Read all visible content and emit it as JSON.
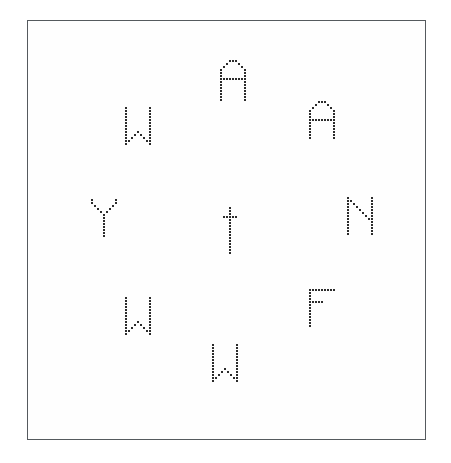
{
  "canvas": {
    "width": 451,
    "height": 463,
    "background_color": "#ffffff"
  },
  "frame": {
    "label": "stimulus-border",
    "x": 27,
    "y": 20,
    "width": 399,
    "height": 420,
    "border_color": "#555a5e",
    "border_width": 1,
    "fill_color": "#fefefe"
  },
  "style": {
    "dot_color": "#2b2b2b",
    "dot_size": 2,
    "dot_pitch": 3,
    "render_mode": "dot-matrix"
  },
  "letters": [
    {
      "id": "letter-top",
      "character": "A",
      "position": "top",
      "x": 220,
      "y": 60,
      "cols": 9,
      "rows": 14,
      "cells": [
        "...###...",
        "..#...#..",
        ".#.....#.",
        "#.......#",
        "#.......#",
        "#.......#",
        "#########",
        "#.......#",
        "#.......#",
        "#.......#",
        "#.......#",
        "#.......#",
        "#.......#",
        "#.......#"
      ]
    },
    {
      "id": "letter-upper-left",
      "character": "W",
      "position": "upper-left",
      "x": 125,
      "y": 107,
      "cols": 9,
      "rows": 13,
      "cells": [
        "#.......#",
        "#.......#",
        "#.......#",
        "#.......#",
        "#.......#",
        "#.......#",
        "#.......#",
        "#.......#",
        "#...#...#",
        "#..#.#..#",
        "#.#...#.#",
        "##.....##",
        "#.......#"
      ]
    },
    {
      "id": "letter-upper-right",
      "character": "A",
      "position": "upper-right",
      "x": 309,
      "y": 101,
      "cols": 9,
      "rows": 13,
      "cells": [
        "...###...",
        "..#...#..",
        ".#.....#.",
        "#.......#",
        "#.......#",
        "#.......#",
        "#########",
        "#.......#",
        "#.......#",
        "#.......#",
        "#.......#",
        "#.......#",
        "#.......#"
      ]
    },
    {
      "id": "letter-left",
      "character": "Y",
      "position": "left",
      "x": 91,
      "y": 199,
      "cols": 9,
      "rows": 13,
      "cells": [
        "#.......#",
        "#.......#",
        ".#.....#.",
        "..#...#..",
        "...#.#...",
        "....#....",
        "....#....",
        "....#....",
        "....#....",
        "....#....",
        "....#....",
        "....#....",
        "....#...."
      ]
    },
    {
      "id": "letter-center",
      "character": "t",
      "position": "center",
      "x": 220,
      "y": 207,
      "cols": 7,
      "rows": 16,
      "cells": [
        "...#...",
        "...#...",
        "...#...",
        ".#####.",
        "...#...",
        "...#...",
        "...#...",
        "...#...",
        "...#...",
        "...#...",
        "...#...",
        "...#...",
        "...#...",
        "...#...",
        "...#...",
        "...#..."
      ]
    },
    {
      "id": "letter-right",
      "character": "N",
      "position": "right",
      "x": 347,
      "y": 197,
      "cols": 9,
      "rows": 13,
      "cells": [
        "#.......#",
        "##......#",
        "#.#.....#",
        "#..#....#",
        "#...#...#",
        "#....#..#",
        "#.....#.#",
        "#......##",
        "#.......#",
        "#.......#",
        "#.......#",
        "#.......#",
        "#.......#"
      ]
    },
    {
      "id": "letter-lower-left",
      "character": "W",
      "position": "lower-left",
      "x": 125,
      "y": 297,
      "cols": 9,
      "rows": 13,
      "cells": [
        "#.......#",
        "#.......#",
        "#.......#",
        "#.......#",
        "#.......#",
        "#.......#",
        "#.......#",
        "#.......#",
        "#...#...#",
        "#..#.#..#",
        "#.#...#.#",
        "##.....##",
        "#.......#"
      ]
    },
    {
      "id": "letter-lower-right",
      "character": "F",
      "position": "lower-right",
      "x": 309,
      "y": 289,
      "cols": 9,
      "rows": 13,
      "cells": [
        "#########",
        "#........",
        "#........",
        "#........",
        "#####....",
        "#........",
        "#........",
        "#........",
        "#........",
        "#........",
        "#........",
        "#........",
        "#........"
      ]
    },
    {
      "id": "letter-bottom",
      "character": "W",
      "position": "bottom",
      "x": 212,
      "y": 344,
      "cols": 9,
      "rows": 13,
      "cells": [
        "#.......#",
        "#.......#",
        "#.......#",
        "#.......#",
        "#.......#",
        "#.......#",
        "#.......#",
        "#.......#",
        "#...#...#",
        "#..#.#..#",
        "#.#...#.#",
        "##.....##",
        "#.......#"
      ]
    }
  ]
}
